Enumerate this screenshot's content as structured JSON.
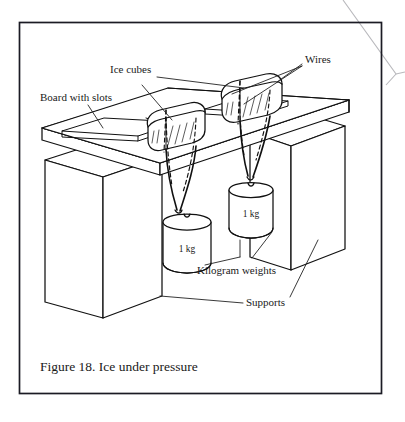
{
  "figure": {
    "caption": "Figure 18.  Ice under pressure",
    "caption_number": "Figure 18.",
    "caption_title": "Ice under pressure",
    "background_color": "#ffffff",
    "line_color": "#111111",
    "frame_color": "#1b1b24"
  },
  "labels": {
    "board": "Board with slots",
    "ice_cubes": "Ice cubes",
    "wires": "Wires",
    "kilogram_weights": "Kilogram weights",
    "supports": "Supports"
  },
  "weights": [
    {
      "id": "left-weight",
      "label": "1 kg",
      "mass_value": 1,
      "mass_unit": "kg"
    },
    {
      "id": "right-weight",
      "label": "1 kg",
      "mass_value": 1,
      "mass_unit": "kg"
    }
  ],
  "parts": {
    "board_name": "board-with-slots",
    "slot_count": 2,
    "ice_cube_count": 2,
    "support_count": 2,
    "wire_count": 2
  }
}
